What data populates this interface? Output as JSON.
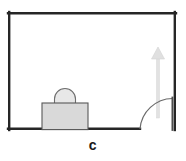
{
  "figure": {
    "caption": "c",
    "type": "floor-plan-diagram"
  },
  "colors": {
    "wall_stroke": "#262626",
    "object_stroke": "#555555",
    "object_fill": "#d9d9d9",
    "arrow_fill": "#e0e0e0",
    "arrow_stroke": "#d2d2d2",
    "door_stroke": "#4d4d4d",
    "arc_stroke": "#6b6b6b",
    "background": "#ffffff",
    "caption_color": "#1a1a1a"
  },
  "room": {
    "name": "room-outline",
    "x": 8,
    "y": 12,
    "width": 168,
    "height": 118,
    "wall_thickness": 2.4,
    "doorway_gap": {
      "start_x": 140,
      "end_x": 172,
      "on_wall": "bottom"
    }
  },
  "suitcase": {
    "name": "suitcase",
    "body": {
      "x": 42,
      "y": 103,
      "width": 46,
      "height": 27
    },
    "handle": {
      "cx": 65,
      "cy": 103,
      "rx": 11,
      "ry": 11
    }
  },
  "door": {
    "name": "door",
    "hinge_x": 172,
    "hinge_y": 130,
    "leaf_top_y": 97,
    "arc_radius": 33,
    "arc_start_x": 140,
    "arc_start_y": 130
  },
  "arrow": {
    "name": "direction-arrow",
    "direction": "up",
    "shaft_x": 158,
    "tail_y": 118,
    "tip_y": 47,
    "head_width": 13,
    "head_height": 12,
    "shaft_width": 3
  }
}
